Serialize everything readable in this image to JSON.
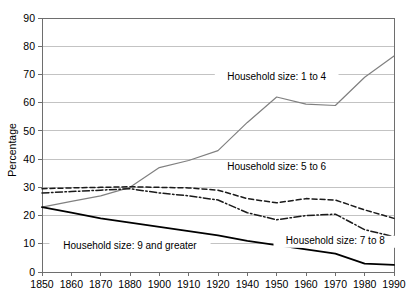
{
  "chart_data": {
    "type": "line",
    "title": "",
    "xlabel": "",
    "ylabel": "Percentage",
    "ylim": [
      0,
      90
    ],
    "ytick_step": 10,
    "grid": true,
    "legend_position": "inline-annotations",
    "x_categorical": true,
    "categories": [
      "1850",
      "1860",
      "1870",
      "1880",
      "1900",
      "1910",
      "1920",
      "1940",
      "1950",
      "1960",
      "1970",
      "1980",
      "1990"
    ],
    "yticks": [
      "0",
      "10",
      "20",
      "30",
      "40",
      "50",
      "60",
      "70",
      "80",
      "90"
    ],
    "series": [
      {
        "name": "Household size: 1 to 4",
        "style": "solid-gray",
        "color": "#808080",
        "values": [
          23,
          25,
          27,
          30,
          37,
          39.5,
          43,
          53,
          62,
          59.5,
          59,
          69,
          76.5
        ],
        "label": "Household size: 1 to 4",
        "label_x": "1950",
        "label_y": 68
      },
      {
        "name": "Household size: 5 to 6",
        "style": "dashed",
        "color": "#1a1a1a",
        "values": [
          29.5,
          29.8,
          30,
          30.2,
          30,
          29.8,
          29,
          26,
          24.5,
          26,
          25.5,
          22,
          19
        ],
        "label": "Household size: 5 to 6",
        "label_x": "1950",
        "label_y": 36
      },
      {
        "name": "Household size: 7 to 8",
        "style": "dash-dot",
        "color": "#1a1a1a",
        "values": [
          28,
          28.5,
          29,
          29.5,
          28,
          27,
          25.5,
          21,
          18.5,
          20,
          20.5,
          15,
          12.5
        ],
        "label": "Household size: 7 to 8",
        "label_x": "1970",
        "label_y": 10
      },
      {
        "name": "Household size: 9 and greater",
        "style": "solid-black",
        "color": "#000000",
        "values": [
          23,
          21,
          19,
          17.5,
          16,
          14.5,
          13,
          11,
          9.5,
          8,
          6.5,
          3,
          2.5
        ],
        "label": "Household size: 9 and greater",
        "label_x": "1880",
        "label_y": 8
      }
    ]
  }
}
